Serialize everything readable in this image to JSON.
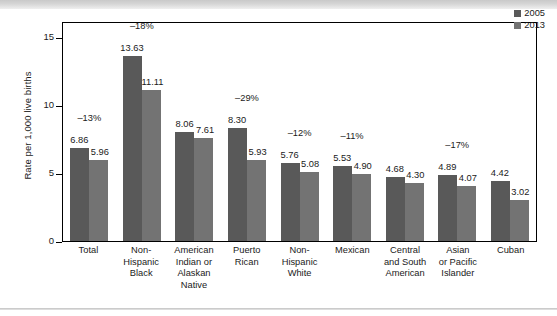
{
  "chart_data": {
    "type": "bar",
    "title": "",
    "subtitle": "",
    "xlabel": "",
    "ylabel": "Rate per 1,000 live births",
    "ylim": [
      0,
      16.2
    ],
    "yticks": [
      0,
      5,
      10,
      15
    ],
    "ytick_labels": [
      "0",
      "5",
      "10",
      "15"
    ],
    "grid": false,
    "legend_position": "top-right",
    "categories": [
      "Total",
      "Non-Hispanic Black",
      "American Indian or Alaskan Native",
      "Puerto Rican",
      "Non-Hispanic White",
      "Mexican",
      "Central and South American",
      "Asian or Pacific Islander",
      "Cuban"
    ],
    "category_lines": [
      [
        "Total"
      ],
      [
        "Non-",
        "Hispanic",
        "Black"
      ],
      [
        "American",
        "Indian or",
        "Alaskan",
        "Native"
      ],
      [
        "Puerto",
        "Rican"
      ],
      [
        "Non-",
        "Hispanic",
        "White"
      ],
      [
        "Mexican"
      ],
      [
        "Central",
        "and South",
        "American"
      ],
      [
        "Asian",
        "or Pacific",
        "Islander"
      ],
      [
        "Cuban"
      ]
    ],
    "series": [
      {
        "name": "2005",
        "color": "#595959",
        "values": [
          6.86,
          13.63,
          8.06,
          8.3,
          5.76,
          5.53,
          4.68,
          4.89,
          4.42
        ],
        "labels": [
          "6.86",
          "13.63",
          "8.06",
          "8.30",
          "5.76",
          "5.53",
          "4.68",
          "4.89",
          "4.42"
        ]
      },
      {
        "name": "2013",
        "color": "#737373",
        "values": [
          5.96,
          11.11,
          7.61,
          5.93,
          5.08,
          4.9,
          4.3,
          4.07,
          3.02
        ],
        "labels": [
          "5.96",
          "11.11",
          "7.61",
          "5.93",
          "5.08",
          "4.90",
          "4.30",
          "4.07",
          "3.02"
        ]
      }
    ],
    "percent_change_labels": [
      "–13%",
      "–18%",
      "",
      "–29%",
      "–12%",
      "–11%",
      "",
      "–17%",
      ""
    ]
  },
  "legend": {
    "entries": [
      {
        "label": "2005",
        "color": "#595959"
      },
      {
        "label": "2013",
        "color": "#737373"
      }
    ]
  }
}
